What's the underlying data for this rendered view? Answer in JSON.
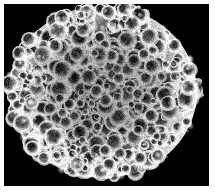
{
  "page": {
    "width": 215,
    "height": 193,
    "background_color": "#ffffff",
    "margin_px": 4
  },
  "micrograph": {
    "name": "sem-micrograph",
    "background_color": "#000000",
    "frame": {
      "x": 4,
      "y": 4,
      "width": 205,
      "height": 182
    },
    "modality": "grayscale scanning electron micrograph",
    "subject": "spheroidal specimen with globular verrucate surface",
    "has_scale_bar": false,
    "has_text_annotation": false,
    "palette": {
      "background": "#000000",
      "shadow": "#050505",
      "midtone": "#6e6e6e",
      "highlight": "#f2f2f2",
      "white": "#ffffff"
    },
    "specimen": {
      "center_x": 103,
      "center_y": 92,
      "radius_x": 94,
      "radius_y": 86,
      "rim_brightness": 245,
      "core_brightness": 40,
      "granule_count": 620,
      "granule_min_radius": 3,
      "granule_max_radius": 11
    },
    "alt_text": "Black and white scanning electron micrograph of a round specimen covered in dense rounded granules with bright rims and dark interiors, on a black background."
  }
}
